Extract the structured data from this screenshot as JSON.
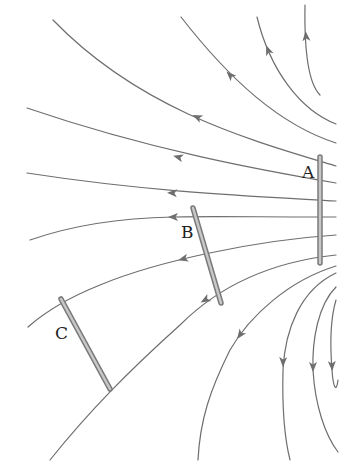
{
  "diagram": {
    "colors": {
      "background": "#ffffff",
      "field_line": "#6e6e6e",
      "arrow": "#6e6e6e",
      "plate_outline": "#7a7a7a",
      "plate_fill": "#c8c8c8",
      "label": "#222222"
    },
    "field_lines": [
      {
        "id": "line-1",
        "path": "M 320 95 C 310 85, 304 60, 305 5",
        "arrow": {
          "x": 306,
          "y": 36,
          "angle": -95
        }
      },
      {
        "id": "line-2",
        "path": "M 336 124 C 300 110, 270 70, 257 17",
        "arrow": {
          "x": 268,
          "y": 50,
          "angle": -112
        }
      },
      {
        "id": "line-3",
        "path": "M 336 143 C 280 125, 230 80, 181 17",
        "arrow": {
          "x": 230,
          "y": 75,
          "angle": -135
        }
      },
      {
        "id": "line-4",
        "path": "M 336 166 C 250 140, 140 110, 53 20",
        "arrow": {
          "x": 197,
          "y": 117,
          "angle": -155
        }
      },
      {
        "id": "line-5",
        "path": "M 336 183 C 260 170, 150 150, 27 108",
        "arrow": {
          "x": 178,
          "y": 157,
          "angle": -165
        }
      },
      {
        "id": "line-6",
        "path": "M 336 201 C 250 196, 150 192, 27 173",
        "arrow": {
          "x": 172,
          "y": 193,
          "angle": -177
        }
      },
      {
        "id": "line-7",
        "path": "M 336 217 C 260 217, 200 216, 173 217 C 120 218, 70 226, 30 240",
        "arrow": {
          "x": 173,
          "y": 217,
          "angle": 180
        }
      },
      {
        "id": "line-8",
        "path": "M 336 235 C 260 240, 160 260, 100 285 C 70 297, 45 312, 28 327",
        "arrow": {
          "x": 183,
          "y": 259,
          "angle": 165
        }
      },
      {
        "id": "line-9",
        "path": "M 336 255 C 270 262, 220 285, 180 325 C 130 370, 90 410, 50 460",
        "arrow": {
          "x": 205,
          "y": 300,
          "angle": 150
        }
      },
      {
        "id": "line-10",
        "path": "M 336 266 C 290 280, 250 315, 230 350 C 210 390, 200 420, 198 460",
        "arrow": {
          "x": 240,
          "y": 335,
          "angle": 125
        }
      },
      {
        "id": "line-11",
        "path": "M 336 273 C 300 290, 285 330, 283 370 C 282 410, 285 440, 290 460",
        "arrow": {
          "x": 283,
          "y": 362,
          "angle": 92
        }
      },
      {
        "id": "line-12",
        "path": "M 336 287 C 318 305, 312 340, 313 370 C 315 405, 325 435, 338 452",
        "arrow": {
          "x": 313,
          "y": 367,
          "angle": 90
        }
      },
      {
        "id": "line-13",
        "path": "M 336 300 C 330 320, 330 345, 332 370 C 333 385, 336 395, 338 380",
        "arrow": {
          "x": 332,
          "y": 366,
          "angle": 88
        }
      }
    ],
    "plates": [
      {
        "id": "A",
        "label": "A",
        "x1": 320,
        "y1": 157,
        "x2": 320,
        "y2": 263,
        "label_x": 302,
        "label_y": 178
      },
      {
        "id": "B",
        "label": "B",
        "x1": 193,
        "y1": 208,
        "x2": 221,
        "y2": 303,
        "label_x": 181,
        "label_y": 238
      },
      {
        "id": "C",
        "label": "C",
        "x1": 61,
        "y1": 299,
        "x2": 110,
        "y2": 389,
        "label_x": 55,
        "label_y": 339
      }
    ]
  }
}
